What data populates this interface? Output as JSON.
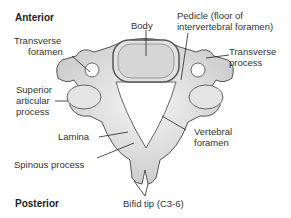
{
  "diagram": {
    "orientation": {
      "top": "Anterior",
      "bottom": "Posterior"
    },
    "labels": {
      "body": "Body",
      "pedicle_1": "Pedicle (floor of",
      "pedicle_2": "intervertebral foramen)",
      "transverse_foramen_1": "Transverse",
      "transverse_foramen_2": "foramen",
      "transverse_process_1": "Transverse",
      "transverse_process_2": "process",
      "superior_articular_1": "Superior",
      "superior_articular_2": "articular",
      "superior_articular_3": "process",
      "lamina": "Lamina",
      "vertebral_foramen_1": "Vertebral",
      "vertebral_foramen_2": "foramen",
      "spinous_process": "Spinous process",
      "bifid_tip": "Bifid tip (C3-6)"
    },
    "colors": {
      "bone": "#e6e6e6",
      "bone_dark": "#bdbdbd",
      "outline": "#555555",
      "body_fill": "#d9d9d9",
      "leader": "#222222"
    }
  }
}
